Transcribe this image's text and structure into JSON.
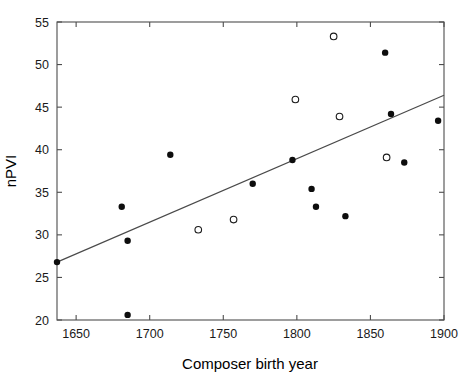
{
  "chart_data": {
    "type": "scatter",
    "title": "",
    "xlabel": "Composer birth year",
    "ylabel": "nPVI",
    "xlim": [
      1637,
      1900
    ],
    "ylim": [
      20,
      55
    ],
    "xticks": [
      1650,
      1700,
      1750,
      1800,
      1850,
      1900
    ],
    "xtick_labels": [
      "1650",
      "1700",
      "1750",
      "1800",
      "1850",
      "1900"
    ],
    "yticks": [
      20,
      25,
      30,
      35,
      40,
      45,
      50,
      55
    ],
    "ytick_labels": [
      "20",
      "25",
      "30",
      "35",
      "40",
      "45",
      "50",
      "55"
    ],
    "grid": false,
    "legend": null,
    "series": [
      {
        "name": "filled",
        "marker": "filled-circle",
        "color": "#0d0d0d",
        "points": [
          {
            "x": 1637,
            "y": 26.8
          },
          {
            "x": 1681,
            "y": 33.3
          },
          {
            "x": 1685,
            "y": 29.3
          },
          {
            "x": 1685,
            "y": 20.6
          },
          {
            "x": 1714,
            "y": 39.4
          },
          {
            "x": 1770,
            "y": 36.0
          },
          {
            "x": 1797,
            "y": 38.8
          },
          {
            "x": 1810,
            "y": 35.4
          },
          {
            "x": 1813,
            "y": 33.3
          },
          {
            "x": 1833,
            "y": 32.2
          },
          {
            "x": 1860,
            "y": 51.4
          },
          {
            "x": 1864,
            "y": 44.2
          },
          {
            "x": 1873,
            "y": 38.5
          },
          {
            "x": 1896,
            "y": 43.4
          }
        ]
      },
      {
        "name": "open",
        "marker": "open-circle",
        "color": "#ffffff",
        "points": [
          {
            "x": 1733,
            "y": 30.6
          },
          {
            "x": 1757,
            "y": 31.8
          },
          {
            "x": 1799,
            "y": 45.9
          },
          {
            "x": 1825,
            "y": 53.3
          },
          {
            "x": 1829,
            "y": 43.9
          },
          {
            "x": 1861,
            "y": 39.1
          }
        ]
      }
    ],
    "trend_line": {
      "name": "regression-line",
      "color": "#4a4a4a",
      "x_start": 1637,
      "y_start": 26.8,
      "x_end": 1900,
      "y_end": 46.4
    }
  }
}
